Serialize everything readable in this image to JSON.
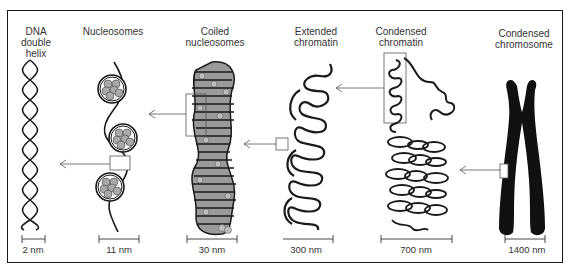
{
  "diagram": {
    "stages": [
      {
        "label": "DNA\ndouble\nhelix",
        "scale": "2 nm"
      },
      {
        "label": "Nucleosomes",
        "scale": "11 nm"
      },
      {
        "label": "Coiled\nnucleosomes",
        "scale": "30 nm"
      },
      {
        "label": "Extended\nchromatin",
        "scale": "300 nm"
      },
      {
        "label": "Condensed\nchromatin",
        "scale": "700 nm"
      },
      {
        "label": "Condensed\nchromosome",
        "scale": "1400 nm"
      }
    ],
    "colors": {
      "line": "#1a1a1a",
      "histone_fill": "#a9a9a9",
      "chromosome_fill": "#111111",
      "arrow": "#555555"
    }
  }
}
